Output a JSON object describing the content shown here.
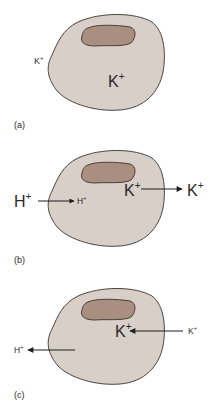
{
  "figure": {
    "panels": [
      {
        "id": "a",
        "label": "(a)",
        "outside_ion": {
          "text": "K",
          "sup": "+"
        },
        "inside_ion": {
          "text": "K",
          "sup": "+"
        }
      },
      {
        "id": "b",
        "label": "(b)",
        "h_outside": {
          "text": "H",
          "sup": "+"
        },
        "h_inside": {
          "text": "H",
          "sup": "+"
        },
        "k_inside": {
          "text": "K",
          "sup": "+"
        },
        "k_outside": {
          "text": "K",
          "sup": "+"
        }
      },
      {
        "id": "c",
        "label": "(c)",
        "k_inside": {
          "text": "K",
          "sup": "+"
        },
        "k_outside": {
          "text": "K",
          "sup": "+"
        },
        "h_outside": {
          "text": "H",
          "sup": "+"
        }
      }
    ],
    "colors": {
      "cell_fill": "#d7cfc8",
      "cell_stroke": "#4a4540",
      "nucleus_fill": "#a88f80",
      "nucleus_stroke": "#4a3f38",
      "arrow": "#1e1e1e",
      "text": "#2a2a2a"
    }
  }
}
